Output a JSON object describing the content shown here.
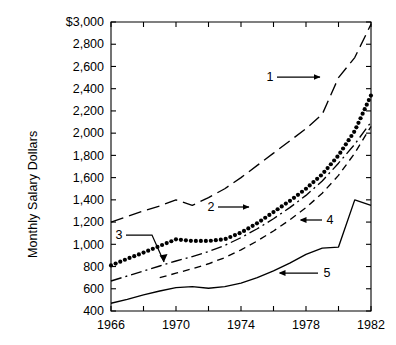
{
  "chart_data": {
    "type": "line",
    "title": "",
    "xlabel": "",
    "ylabel": "Monthly Salary Dollars",
    "xlim": [
      1966,
      1982
    ],
    "ylim": [
      400,
      3000
    ],
    "grid": false,
    "legend_position": "inline-callouts",
    "x_tick_values": [
      1966,
      1968,
      1970,
      1972,
      1974,
      1976,
      1978,
      1980,
      1982
    ],
    "x_tick_labels": [
      "1966",
      "",
      "1970",
      "",
      "1974",
      "",
      "1978",
      "",
      "1982"
    ],
    "x_labels_shown": [
      "1966",
      "1970",
      "1974",
      "1978",
      "1982"
    ],
    "y_tick_values": [
      400,
      600,
      800,
      1000,
      1200,
      1400,
      1600,
      1800,
      2000,
      2200,
      2400,
      2600,
      2800,
      3000
    ],
    "y_tick_labels": [
      "400",
      "600",
      "800",
      "1,000",
      "1,200",
      "1,400",
      "1,600",
      "1,800",
      "2,000",
      "2,200",
      "2,400",
      "2,600",
      "2,800",
      "$3,000"
    ],
    "x": [
      1966,
      1967,
      1968,
      1969,
      1970,
      1971,
      1972,
      1973,
      1974,
      1975,
      1976,
      1977,
      1978,
      1979,
      1980,
      1981,
      1982
    ],
    "series": [
      {
        "name": "1",
        "label": "1",
        "style": "long-dash",
        "color": "#000000",
        "x": [
          1966,
          1967,
          1968,
          1969,
          1970,
          1971,
          1972,
          1973,
          1974,
          1975,
          1976,
          1977,
          1978,
          1979,
          1980,
          1981,
          1982
        ],
        "values": [
          1200,
          1250,
          1300,
          1345,
          1400,
          1350,
          1420,
          1500,
          1600,
          1710,
          1820,
          1930,
          2040,
          2170,
          2500,
          2680,
          2980
        ]
      },
      {
        "name": "2",
        "label": "2",
        "style": "dotted",
        "color": "#000000",
        "x": [
          1966,
          1967,
          1968,
          1969,
          1970,
          1971,
          1972,
          1973,
          1974,
          1975,
          1976,
          1977,
          1978,
          1979,
          1980,
          1981,
          1982
        ],
        "values": [
          810,
          870,
          925,
          985,
          1045,
          1030,
          1030,
          1045,
          1105,
          1190,
          1290,
          1390,
          1500,
          1630,
          1800,
          2020,
          2340
        ]
      },
      {
        "name": "3",
        "label": "3",
        "style": "dash-dot",
        "color": "#000000",
        "x": [
          1966,
          1967,
          1968,
          1969,
          1970,
          1971,
          1972,
          1973,
          1974,
          1975,
          1976,
          1977,
          1978,
          1979,
          1980,
          1981,
          1982
        ],
        "values": [
          670,
          715,
          760,
          805,
          850,
          890,
          935,
          990,
          1060,
          1140,
          1230,
          1330,
          1440,
          1570,
          1730,
          1900,
          2100
        ]
      },
      {
        "name": "4",
        "label": "4",
        "style": "short-dash",
        "color": "#000000",
        "x": [
          1969,
          1970,
          1971,
          1972,
          1973,
          1974,
          1975,
          1976,
          1977,
          1978,
          1979,
          1980,
          1981,
          1982
        ],
        "values": [
          700,
          740,
          780,
          825,
          880,
          950,
          1030,
          1120,
          1220,
          1330,
          1460,
          1620,
          1820,
          2060
        ]
      },
      {
        "name": "5",
        "label": "5",
        "style": "solid",
        "color": "#000000",
        "x": [
          1966,
          1967,
          1968,
          1969,
          1970,
          1971,
          1972,
          1973,
          1974,
          1975,
          1976,
          1977,
          1978,
          1979,
          1980,
          1981,
          1982
        ],
        "values": [
          470,
          505,
          545,
          580,
          610,
          620,
          605,
          620,
          650,
          700,
          760,
          830,
          910,
          965,
          975,
          1400,
          1350
        ]
      }
    ],
    "annotations": [
      {
        "label": "1",
        "arrow": "right",
        "target_series": "1"
      },
      {
        "label": "2",
        "arrow": "right",
        "target_series": "2"
      },
      {
        "label": "3",
        "arrow": "elbow-down-left",
        "target_series": "3"
      },
      {
        "label": "4",
        "arrow": "left",
        "target_series": "4"
      },
      {
        "label": "5",
        "arrow": "left",
        "target_series": "5"
      }
    ]
  },
  "axis": {
    "y_title": "Monthly Salary Dollars"
  }
}
